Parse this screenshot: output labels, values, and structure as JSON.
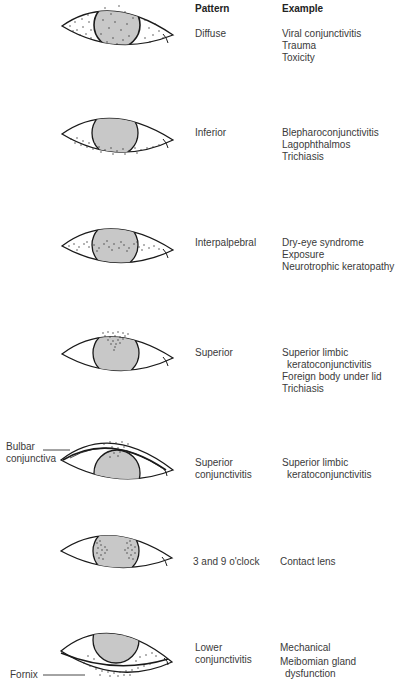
{
  "headers": {
    "pattern": "Pattern",
    "example": "Example"
  },
  "rows": [
    {
      "pattern": [
        "Diffuse"
      ],
      "examples": [
        "Viral conjunctivitis",
        "Trauma",
        "Toxicity"
      ]
    },
    {
      "pattern": [
        "Inferior"
      ],
      "examples": [
        "Blepharoconjunctivitis",
        "Lagophthalmos",
        "Trichiasis"
      ]
    },
    {
      "pattern": [
        "Interpalpebral"
      ],
      "examples": [
        "Dry-eye syndrome",
        "Exposure",
        "Neurotrophic keratopathy"
      ]
    },
    {
      "pattern": [
        "Superior"
      ],
      "examples": [
        "Superior limbic",
        "keratoconjunctivitis",
        "Foreign body under lid",
        "Trichiasis"
      ]
    },
    {
      "pattern": [
        "Superior",
        "conjunctivitis"
      ],
      "examples": [
        "Superior limbic",
        "keratoconjunctivitis"
      ]
    },
    {
      "pattern": [
        "3 and 9 o'clock"
      ],
      "examples": [
        "Contact lens"
      ]
    },
    {
      "pattern": [
        "Lower",
        "conjunctivitis"
      ],
      "examples": [
        "Mechanical",
        "Meibomian gland",
        "dysfunction"
      ]
    }
  ],
  "annotations": {
    "bulbar": [
      "Bulbar",
      "conjunctiva"
    ],
    "fornix": "Fornix"
  },
  "colors": {
    "cornea_fill": "#c8c8c8",
    "outline": "#1a1a1a",
    "dots": "#333333"
  }
}
